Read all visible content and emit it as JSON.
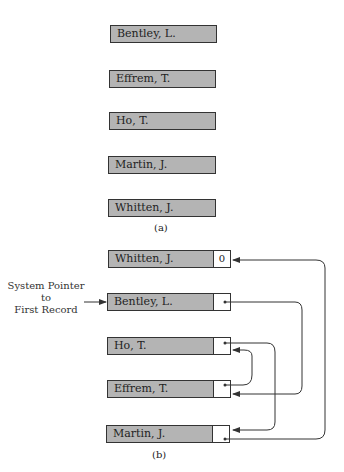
{
  "part_a": {
    "caption": "(a)",
    "records": [
      {
        "name": "Bentley, L."
      },
      {
        "name": "Effrem, T."
      },
      {
        "name": "Ho, T."
      },
      {
        "name": "Martin, J."
      },
      {
        "name": "Whitten, J."
      }
    ]
  },
  "part_b": {
    "caption": "(b)",
    "system_pointer_label": [
      "System Pointer",
      "to",
      "First Record"
    ],
    "records": [
      {
        "name": "Whitten, J.",
        "pointer": "0"
      },
      {
        "name": "Bentley, L.",
        "pointer": "•"
      },
      {
        "name": "Ho, T.",
        "pointer": "•"
      },
      {
        "name": "Effrem, T.",
        "pointer": "•"
      },
      {
        "name": "Martin, J.",
        "pointer": "•"
      }
    ],
    "links": [
      {
        "from": "Bentley, L.",
        "to": "Effrem, T."
      },
      {
        "from": "Effrem, T.",
        "to": "Ho, T."
      },
      {
        "from": "Ho, T.",
        "to": "Martin, J."
      },
      {
        "from": "Martin, J.",
        "to": "Whitten, J."
      }
    ]
  }
}
